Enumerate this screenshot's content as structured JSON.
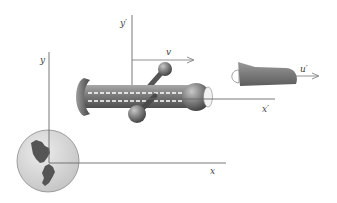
{
  "diagram": {
    "frames": {
      "lab": {
        "x_label": "x",
        "y_label": "y"
      },
      "moving": {
        "x_label": "x′",
        "y_label": "y′",
        "velocity_label": "v"
      }
    },
    "objects": {
      "spaceship": "ship-with-tube-and-spheres",
      "projectile": {
        "velocity_label": "u′"
      },
      "planet": "globe-with-continents"
    },
    "colors": {
      "axis": "#6a6a6a",
      "ship_body": "#7d7d7d",
      "ship_dark": "#4a4a4a",
      "planet_fill": "#d8d8d8",
      "continent": "#555555",
      "background": "#ffffff"
    }
  }
}
